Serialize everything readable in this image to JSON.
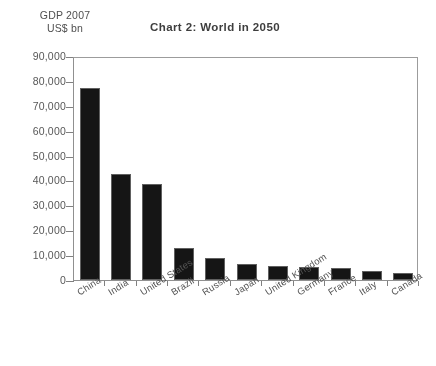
{
  "chart_data": {
    "type": "bar",
    "title": "Chart 2: World in 2050",
    "ylabel": "GDP 2007\nUS$ bn",
    "xlabel": "",
    "ylim": [
      0,
      90000
    ],
    "ytick_labels": [
      "90,000",
      "80,000",
      "70,000",
      "60,000",
      "50,000",
      "40,000",
      "30,000",
      "20,000",
      "10,000",
      "0"
    ],
    "ytick_values": [
      90000,
      80000,
      70000,
      60000,
      50000,
      40000,
      30000,
      20000,
      10000,
      0
    ],
    "grid": false,
    "legend": "none",
    "bar_color": "#101010",
    "categories": [
      "China",
      "India",
      "United States",
      "Brazil",
      "Russia",
      "Japan",
      "United Kingdom",
      "Germany",
      "France",
      "Italy",
      "Canada"
    ],
    "values": [
      77000,
      42500,
      38500,
      13000,
      9000,
      6500,
      5500,
      5300,
      5000,
      3500,
      2900
    ]
  }
}
